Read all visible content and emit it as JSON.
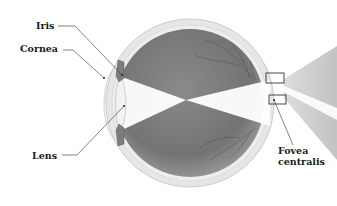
{
  "diagram": {
    "labels": {
      "iris": "Iris",
      "cornea": "Cornea",
      "lens": "Lens",
      "fovea_line1": "Fovea",
      "fovea_line2": "centralis"
    },
    "colors": {
      "background": "#ffffff",
      "sclera": "#e4e4e4",
      "sclera_edge": "#c8c8c8",
      "interior_dark": "#6f6f6f",
      "interior_light": "#9a9a9a",
      "light_beam": "#ffffff",
      "cone": "#bdbdbd",
      "iris": "#7a7a7a",
      "leader_line": "#333333",
      "label_text": "#1a1a1a"
    }
  }
}
